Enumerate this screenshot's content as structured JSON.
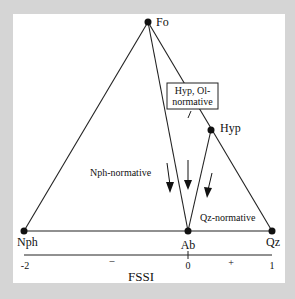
{
  "diagram": {
    "type": "ternary-projection",
    "vertices": [
      {
        "id": "Fo",
        "label": "Fo",
        "x": 148,
        "y": 22
      },
      {
        "id": "Hyp",
        "label": "Hyp",
        "x": 211,
        "y": 130
      },
      {
        "id": "Nph",
        "label": "Nph",
        "x": 24,
        "y": 231
      },
      {
        "id": "Ab",
        "label": "Ab",
        "x": 188,
        "y": 231
      },
      {
        "id": "Qz",
        "label": "Qz",
        "x": 272,
        "y": 231
      }
    ],
    "edges": [
      [
        "Fo",
        "Nph"
      ],
      [
        "Fo",
        "Ab"
      ],
      [
        "Fo",
        "Qz"
      ],
      [
        "Hyp",
        "Ab"
      ],
      [
        "Nph",
        "Qz"
      ]
    ],
    "fields": {
      "nph": "Nph-normative",
      "qz": "Qz-normative",
      "hyp_ol_line1": "Hyp, Ol-",
      "hyp_ol_line2": "normative"
    },
    "axis": {
      "title": "FSSI",
      "ticks": [
        {
          "label": "-2",
          "position": "Nph"
        },
        {
          "label": "0",
          "position": "Ab"
        },
        {
          "label": "1",
          "position": "Qz"
        }
      ],
      "sign_negative": "–",
      "sign_positive": "+"
    },
    "colors": {
      "background": "#d5d5d5",
      "panel": "#ffffff",
      "ink": "#111111"
    }
  }
}
